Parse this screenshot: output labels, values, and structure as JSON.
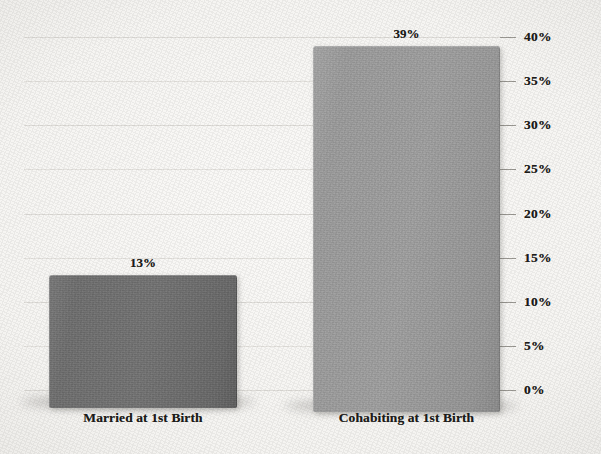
{
  "chart_data": {
    "type": "bar",
    "title": "",
    "subtitle": "",
    "xlabel": "",
    "ylabel": "",
    "categories": [
      "Married at 1st Birth",
      "Cohabiting at 1st Birth"
    ],
    "values": [
      13,
      39
    ],
    "value_labels": [
      "13%",
      "39%"
    ],
    "ylim": [
      0,
      40
    ],
    "ytick_values": [
      0,
      5,
      10,
      15,
      20,
      25,
      30,
      35,
      40
    ],
    "ytick_labels": [
      "0%",
      "5%",
      "10%",
      "15%",
      "20%",
      "25%",
      "30%",
      "35%",
      "40%"
    ],
    "grid": true,
    "grid_axis": "y",
    "legend": false,
    "legend_position": "none",
    "axis_position": "right",
    "bar_colors": [
      "#6e6e6e",
      "#9b9b9b"
    ],
    "background_color": "#f7f6f4",
    "gridline_color": "#dedcd8",
    "text_color": "#1d1c1a",
    "series": [
      {
        "name": "Percent",
        "values": [
          13,
          39
        ]
      }
    ],
    "bars": [
      {
        "category": "Married at 1st Birth",
        "value": 13,
        "label": "13%",
        "color": "#6e6e6e"
      },
      {
        "category": "Cohabiting at 1st Birth",
        "value": 39,
        "label": "39%",
        "color": "#9b9b9b"
      }
    ]
  }
}
